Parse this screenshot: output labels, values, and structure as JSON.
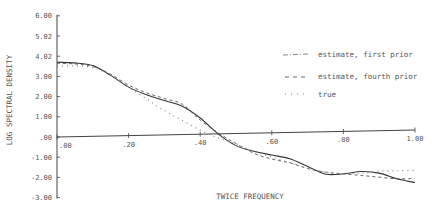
{
  "chart_data": {
    "type": "line",
    "title": "",
    "xlabel": "TWICE FREQUENCY",
    "ylabel": "LOG SPECTRAL DENSITY",
    "xlim": [
      0,
      1
    ],
    "ylim": [
      -3,
      6
    ],
    "grid": false,
    "legend_position": "upper right",
    "x_ticks": [
      ".00",
      ".20",
      ".40",
      ".60",
      ".80",
      "1.00"
    ],
    "y_ticks": [
      "6.00",
      "5.02",
      "4.02",
      "3.00",
      "2.00",
      "1.00",
      ".00",
      "-1.00",
      "-2.00",
      "-3.00"
    ],
    "x": [
      0.0,
      0.05,
      0.1,
      0.15,
      0.2,
      0.25,
      0.3,
      0.35,
      0.4,
      0.45,
      0.5,
      0.55,
      0.6,
      0.65,
      0.7,
      0.75,
      0.8,
      0.85,
      0.9,
      0.95,
      1.0
    ],
    "series": [
      {
        "name": "estimate, first prior",
        "style": "solid",
        "values": [
          3.7,
          3.65,
          3.5,
          3.0,
          2.4,
          2.0,
          1.7,
          1.4,
          0.8,
          0.0,
          -0.6,
          -0.9,
          -1.1,
          -1.3,
          -1.7,
          -2.1,
          -2.1,
          -2.0,
          -2.1,
          -2.4,
          -2.6
        ]
      },
      {
        "name": "estimate, fourth prior",
        "style": "dashed",
        "values": [
          3.65,
          3.6,
          3.45,
          3.05,
          2.5,
          2.1,
          1.8,
          1.5,
          0.7,
          0.05,
          -0.5,
          -1.0,
          -1.3,
          -1.5,
          -1.8,
          -2.0,
          -2.1,
          -2.2,
          -2.3,
          -2.4,
          -2.4
        ]
      },
      {
        "name": "true",
        "style": "dotted",
        "values": [
          3.5,
          3.5,
          3.4,
          3.0,
          2.4,
          1.8,
          1.2,
          0.7,
          0.2,
          -0.2,
          -0.5,
          -0.9,
          -1.2,
          -1.5,
          -1.8,
          -2.0,
          -2.1,
          -2.1,
          -2.0,
          -2.0,
          -2.0
        ]
      }
    ]
  },
  "legend": {
    "items": [
      {
        "label": "estimate, first prior",
        "symbol": "-·-·-"
      },
      {
        "label": "estimate, fourth prior",
        "symbol": "- - -"
      },
      {
        "label": "true",
        "symbol": "· · ·"
      }
    ]
  }
}
